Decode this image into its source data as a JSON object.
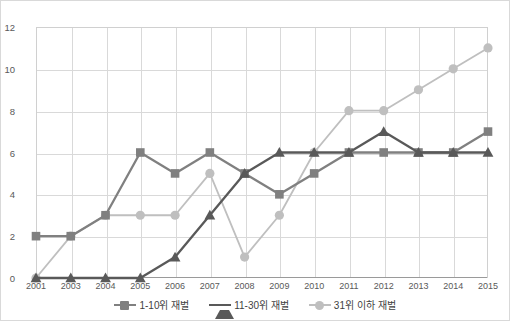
{
  "chart_data": {
    "type": "line",
    "title": "",
    "xlabel": "",
    "ylabel": "",
    "ylim": [
      0,
      12
    ],
    "ytick_values": [
      0,
      2,
      4,
      6,
      8,
      10,
      12
    ],
    "ytick_labels": [
      "0",
      "2",
      "4",
      "6",
      "8",
      "10",
      "12"
    ],
    "grid": true,
    "legend_position": "bottom",
    "categories": [
      "2001",
      "2003",
      "2004",
      "2005",
      "2006",
      "2007",
      "2008",
      "2009",
      "2010",
      "2011",
      "2012",
      "2013",
      "2014",
      "2015"
    ],
    "series": [
      {
        "name": "1-10위 재벌",
        "marker": "square",
        "color": "#808080",
        "values": [
          2,
          2,
          3,
          6,
          5,
          6,
          5,
          4,
          5,
          6,
          6,
          6,
          6,
          7
        ]
      },
      {
        "name": "11-30위 재벌",
        "marker": "triangle",
        "color": "#595959",
        "values": [
          0,
          0,
          0,
          0,
          1,
          3,
          5,
          6,
          6,
          6,
          7,
          6,
          6,
          6
        ]
      },
      {
        "name": "31위 이하 재벌",
        "marker": "circle",
        "color": "#bfbfbf",
        "values": [
          0,
          2,
          3,
          3,
          3,
          5,
          1,
          3,
          6,
          8,
          8,
          9,
          10,
          11
        ]
      }
    ]
  },
  "colors": {
    "series_1": "#808080",
    "series_2": "#595959",
    "series_3": "#bfbfbf",
    "grid": "#d9d9d9",
    "axis": "#9a9a9a",
    "tick_text": "#595959",
    "border": "#d9d9d9",
    "background": "#ffffff"
  }
}
